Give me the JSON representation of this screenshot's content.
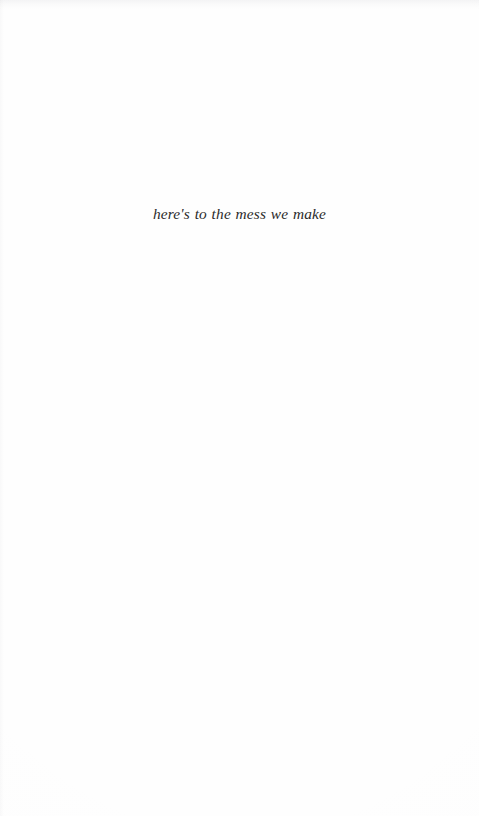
{
  "page": {
    "background_color": "#fefefe",
    "width": 479,
    "height": 816
  },
  "content": {
    "epigraph": {
      "text": "here's to the mess we make",
      "style": "italic-serif",
      "ink_color": "#2b2b2b",
      "alignment": "center"
    }
  }
}
